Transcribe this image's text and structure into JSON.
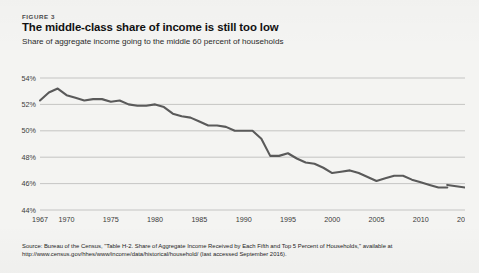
{
  "figure": {
    "label": "FIGURE 3",
    "title": "The middle-class share of income is still too low",
    "subtitle": "Share of aggregate income going to the middle 60 percent of households"
  },
  "source": {
    "line1": "Source: Bureau of the Census, \"Table H-2. Share of Aggregate Income Received by Each Fifth and Top 5 Percent of Households,\" available at",
    "line2": "http://www.census.gov/hhes/www/income/data/historical/household/ (last accessed September 2016)."
  },
  "colors": {
    "line": "#5a5a5a",
    "grid": "#b9b9b7",
    "background": "#f4f4f2",
    "text": "#1a1a1a"
  },
  "chart_data": {
    "type": "line",
    "title": "The middle-class share of income is still too low",
    "subtitle": "Share of aggregate income going to the middle 60 percent of households",
    "xlabel": "",
    "ylabel": "",
    "xlim": [
      1967,
      2015
    ],
    "ylim": [
      44,
      54
    ],
    "grid": true,
    "legend": false,
    "ytick_labels": [
      "54%",
      "52%",
      "50%",
      "48%",
      "46%",
      "44%"
    ],
    "ytick_values": [
      54,
      52,
      50,
      48,
      46,
      44
    ],
    "xtick_labels": [
      "1967",
      "1970",
      "1975",
      "1980",
      "1985",
      "1990",
      "1995",
      "2000",
      "2005",
      "2010",
      "2015"
    ],
    "xtick_values": [
      1967,
      1970,
      1975,
      1980,
      1985,
      1990,
      1995,
      2000,
      2005,
      2010,
      2015
    ],
    "series": [
      {
        "name": "Middle 60 percent share of aggregate income",
        "x": [
          1967,
          1968,
          1969,
          1970,
          1971,
          1972,
          1973,
          1974,
          1975,
          1976,
          1977,
          1978,
          1979,
          1980,
          1981,
          1982,
          1983,
          1984,
          1985,
          1986,
          1987,
          1988,
          1989,
          1990,
          1991,
          1992,
          1993,
          1994,
          1995,
          1996,
          1997,
          1998,
          1999,
          2000,
          2001,
          2002,
          2003,
          2004,
          2005,
          2006,
          2007,
          2008,
          2009,
          2010,
          2011,
          2012,
          2013
        ],
        "values": [
          52.3,
          52.9,
          53.2,
          52.7,
          52.5,
          52.3,
          52.4,
          52.4,
          52.2,
          52.3,
          52.0,
          51.9,
          51.9,
          52.0,
          51.8,
          51.3,
          51.1,
          51.0,
          50.7,
          50.4,
          50.4,
          50.3,
          50.0,
          50.0,
          50.0,
          49.4,
          48.1,
          48.1,
          48.3,
          47.9,
          47.6,
          47.5,
          47.2,
          46.8,
          46.9,
          47.0,
          46.8,
          46.5,
          46.2,
          46.4,
          46.6,
          46.6,
          46.3,
          46.1,
          45.9,
          45.7,
          45.7
        ]
      },
      {
        "name": "Middle 60 percent share (revised series)",
        "x": [
          2013,
          2014,
          2015
        ],
        "values": [
          45.9,
          45.8,
          45.7
        ]
      }
    ]
  }
}
